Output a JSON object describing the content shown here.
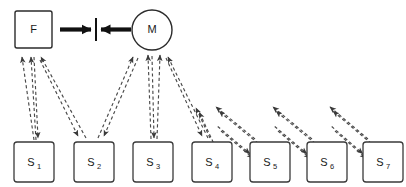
{
  "diagram": {
    "canvas": {
      "width": 406,
      "height": 187,
      "background": "#ffffff"
    },
    "colors": {
      "node_stroke": "#2b2b2b",
      "s_node_stroke": "#3a3a3a",
      "dashed_edge": "#4a4a4a",
      "solid_arrow": "#111111",
      "label_text": "#1a1a1a",
      "background": "#ffffff"
    },
    "top_nodes": [
      {
        "id": "F",
        "label": "F",
        "shape": "square",
        "x": 15,
        "y": 11,
        "width": 37,
        "height": 37,
        "cx": 33.5,
        "cy": 29.5
      },
      {
        "id": "M",
        "label": "M",
        "shape": "circle",
        "cx": 152,
        "cy": 30,
        "r": 20
      }
    ],
    "center_divider": {
      "name": "divider-bar",
      "x": 96,
      "y_top": 18,
      "y_bottom": 41
    },
    "solid_arrows": [
      {
        "name": "arrow-f-to-divider",
        "from": "F",
        "to": "divider",
        "x1": 60,
        "y1": 29.5,
        "x2": 91,
        "y2": 29.5,
        "direction": "right"
      },
      {
        "name": "arrow-m-to-divider",
        "from": "M",
        "to": "divider",
        "x1": 131,
        "y1": 29.5,
        "x2": 101,
        "y2": 29.5,
        "direction": "left"
      }
    ],
    "s_nodes": [
      {
        "id": "S1",
        "label": "S",
        "sub": "1",
        "x": 14,
        "y": 142,
        "width": 40,
        "height": 40,
        "cx": 34,
        "cy": 162
      },
      {
        "id": "S2",
        "label": "S",
        "sub": "2",
        "x": 74,
        "y": 142,
        "width": 40,
        "height": 40,
        "cx": 94,
        "cy": 162
      },
      {
        "id": "S3",
        "label": "S",
        "sub": "3",
        "x": 133,
        "y": 142,
        "width": 40,
        "height": 40,
        "cx": 153,
        "cy": 162
      },
      {
        "id": "S4",
        "label": "S",
        "sub": "4",
        "x": 192,
        "y": 142,
        "width": 40,
        "height": 40,
        "cx": 212,
        "cy": 162
      },
      {
        "id": "S5",
        "label": "S",
        "sub": "5",
        "x": 250,
        "y": 142,
        "width": 40,
        "height": 40,
        "cx": 270,
        "cy": 162
      },
      {
        "id": "S6",
        "label": "S",
        "sub": "6",
        "x": 307,
        "y": 142,
        "width": 40,
        "height": 40,
        "cx": 327,
        "cy": 162
      },
      {
        "id": "S7",
        "label": "S",
        "sub": "7",
        "x": 363,
        "y": 142,
        "width": 40,
        "height": 40,
        "cx": 383,
        "cy": 162
      }
    ],
    "f_fan_edges": [
      {
        "name": "edge-s1-to-f-a",
        "x1": 34,
        "y1": 140,
        "x2": 22,
        "y2": 57,
        "arrow_at": "top"
      },
      {
        "name": "edge-s1-to-f-b",
        "x1": 36,
        "y1": 140,
        "x2": 31,
        "y2": 57,
        "arrow_at": "top"
      },
      {
        "name": "edge-s2-to-f",
        "x1": 86,
        "y1": 138,
        "x2": 41,
        "y2": 57,
        "arrow_at": "top"
      },
      {
        "name": "edge-f-to-s1",
        "x1": 34,
        "y1": 57,
        "x2": 38,
        "y2": 138,
        "arrow_at": "bottom"
      },
      {
        "name": "edge-f-to-s2",
        "x1": 40,
        "y1": 60,
        "x2": 78,
        "y2": 136,
        "arrow_at": "bottom"
      }
    ],
    "m_fan_edges": [
      {
        "name": "edge-s2-to-m",
        "x1": 98,
        "y1": 138,
        "x2": 133,
        "y2": 57,
        "arrow_at": "top"
      },
      {
        "name": "edge-s3-to-m",
        "x1": 151,
        "y1": 139,
        "x2": 148,
        "y2": 55,
        "arrow_at": "top"
      },
      {
        "name": "edge-s3-to-m-b",
        "x1": 157,
        "y1": 139,
        "x2": 160,
        "y2": 55,
        "arrow_at": "top"
      },
      {
        "name": "edge-s4-to-m",
        "x1": 208,
        "y1": 138,
        "x2": 168,
        "y2": 57,
        "arrow_at": "top"
      },
      {
        "name": "edge-m-to-s2",
        "x1": 138,
        "y1": 58,
        "x2": 104,
        "y2": 136,
        "arrow_at": "bottom"
      },
      {
        "name": "edge-m-to-s3",
        "x1": 152,
        "y1": 56,
        "x2": 154,
        "y2": 138,
        "arrow_at": "bottom"
      },
      {
        "name": "edge-m-to-s4",
        "x1": 166,
        "y1": 58,
        "x2": 202,
        "y2": 136,
        "arrow_at": "bottom"
      }
    ],
    "chain_edges": [
      {
        "name": "edge-s4-s5-forward",
        "from": "S4",
        "to": "S5",
        "x1": 221,
        "y1": 131,
        "x2": 253,
        "y2": 158,
        "direction": "down-right"
      },
      {
        "name": "edge-s5-s4-back",
        "from": "S5",
        "to": "S4",
        "x1": 255,
        "y1": 139,
        "x2": 216,
        "y2": 107,
        "direction": "up-left"
      },
      {
        "name": "edge-s5-s6-forward",
        "from": "S5",
        "to": "S6",
        "x1": 278,
        "y1": 131,
        "x2": 310,
        "y2": 158,
        "direction": "down-right"
      },
      {
        "name": "edge-s6-s5-back",
        "from": "S6",
        "to": "S5",
        "x1": 312,
        "y1": 139,
        "x2": 273,
        "y2": 107,
        "direction": "up-left"
      },
      {
        "name": "edge-s6-s7-forward",
        "from": "S6",
        "to": "S7",
        "x1": 335,
        "y1": 131,
        "x2": 366,
        "y2": 158,
        "direction": "down-right"
      },
      {
        "name": "edge-s7-s6-back",
        "from": "S7",
        "to": "S6",
        "x1": 368,
        "y1": 139,
        "x2": 330,
        "y2": 107,
        "direction": "up-left"
      },
      {
        "name": "edge-s4-upleft-extra",
        "from": "S4",
        "to": "up",
        "x1": 210,
        "y1": 138,
        "x2": 196,
        "y2": 108,
        "direction": "up-left"
      }
    ]
  }
}
